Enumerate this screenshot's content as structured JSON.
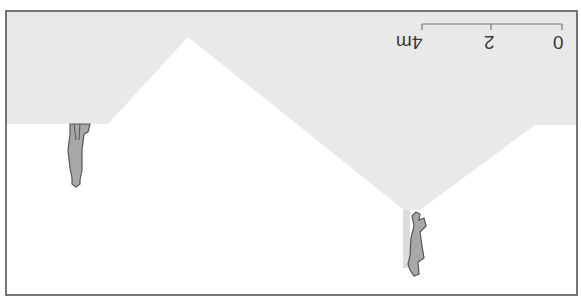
{
  "diagram": {
    "orientation": "rotated-180",
    "colors": {
      "frame": "#4a4a4a",
      "sky_fill": "#e9e9e9",
      "ground_fill": "#ffffff",
      "figure_fill": "#a8a8a8",
      "figure_stroke": "#555555",
      "pole_fill": "#d8d8d8"
    },
    "scale_bar": {
      "labels": [
        "0",
        "2",
        "4m"
      ]
    },
    "figures": [
      {
        "name": "person-left",
        "description": "person standing on flat ledge"
      },
      {
        "name": "person-right",
        "description": "person standing at valley bottom next to pole"
      }
    ]
  }
}
